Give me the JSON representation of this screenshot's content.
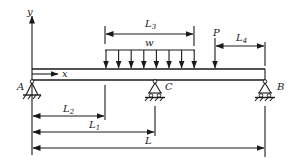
{
  "diagram": {
    "type": "beam-diagram",
    "colors": {
      "stroke": "#1a1a1a",
      "background": "#ffffff"
    },
    "axes": {
      "y_label": "y",
      "x_label": "x"
    },
    "supports": {
      "A": {
        "label": "A",
        "type": "pin"
      },
      "C": {
        "label": "C",
        "type": "roller"
      },
      "B": {
        "label": "B",
        "type": "roller"
      }
    },
    "loads": {
      "distributed": {
        "label": "w",
        "arrow_count": 8
      },
      "point": {
        "label": "P"
      }
    },
    "dimensions": {
      "L3": {
        "main": "L",
        "sub": "3"
      },
      "L4": {
        "main": "L",
        "sub": "4"
      },
      "L2": {
        "main": "L",
        "sub": "2"
      },
      "L1": {
        "main": "L",
        "sub": "1"
      },
      "L": {
        "main": "L",
        "sub": ""
      }
    }
  }
}
